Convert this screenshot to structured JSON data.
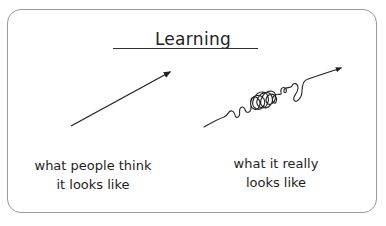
{
  "title": "Learning",
  "left_panel": {
    "caption_line1": "what people think",
    "caption_line2": "it looks like",
    "drawing": "straight-arrow"
  },
  "right_panel": {
    "caption_line1": "what it really",
    "caption_line2": "looks like",
    "drawing": "squiggly-arrow"
  },
  "colors": {
    "ink": "#222222",
    "card_border": "#9a9a9a",
    "background": "#ffffff"
  }
}
